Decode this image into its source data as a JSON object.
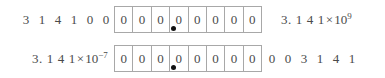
{
  "diagram": {
    "radix_point_symbol": "•",
    "colors": {
      "box_border": "#a8a8a8",
      "text": "#4a4a4a",
      "radix_dot": "#111111",
      "background": "#ffffff"
    },
    "rows": [
      {
        "id": "row-1",
        "leading_digits": [
          "3",
          "1",
          "4",
          "1",
          "0",
          "0"
        ],
        "boxes": [
          "0",
          "0",
          "0",
          "0",
          "0",
          "0",
          "0",
          "0"
        ],
        "box_count": 8,
        "radix_after_box_index": 4,
        "trailing_digits": [],
        "sci_label": {
          "mantissa": "3. 1 4 1",
          "times": "×",
          "base": "10",
          "exponent": "9",
          "full": "3.141×10⁹"
        },
        "sci_label_side": "right"
      },
      {
        "id": "row-2",
        "leading_digits": [],
        "boxes": [
          "0",
          "0",
          "0",
          "0",
          "0",
          "0",
          "0",
          "0"
        ],
        "box_count": 8,
        "radix_after_box_index": 4,
        "trailing_digits": [
          "0",
          "0",
          "3",
          "1",
          "4",
          "1"
        ],
        "sci_label": {
          "mantissa": "3. 1 4 1",
          "times": "×",
          "base": "10",
          "exponent": "−7",
          "full": "3.141×10⁻⁷"
        },
        "sci_label_side": "left"
      }
    ]
  }
}
